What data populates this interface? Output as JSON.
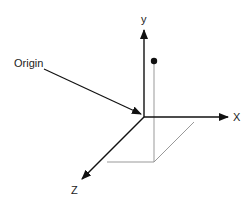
{
  "diagram": {
    "type": "3d-coordinate-axes",
    "labels": {
      "origin": "Origin",
      "x_axis": "X",
      "y_axis": "y",
      "z_axis": "Z"
    },
    "colors": {
      "axis": "#111111",
      "projection": "#999999",
      "point": "#111111",
      "background": "#ffffff"
    },
    "elements": [
      "x-axis arrow",
      "y-axis arrow",
      "z-axis arrow",
      "origin callout arrow",
      "point above xz-plane",
      "projection lines"
    ]
  }
}
